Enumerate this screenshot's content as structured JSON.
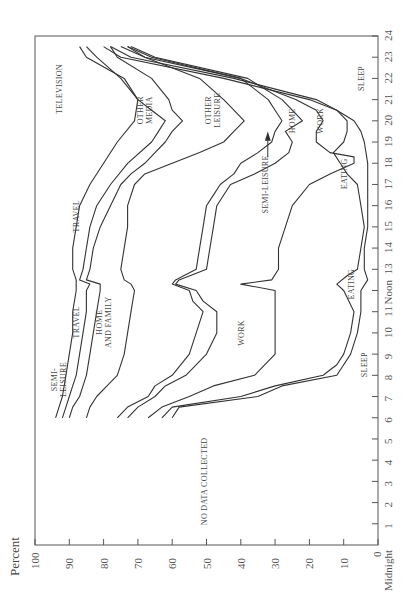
{
  "chart_data": {
    "type": "area",
    "orientation": "rotated-90-clockwise",
    "title": "",
    "ylabel": "Percent",
    "xlabel": "Hour of day",
    "ylim": [
      0,
      100
    ],
    "xlim": [
      0,
      24
    ],
    "percent_ticks": [
      100,
      90,
      80,
      70,
      60,
      50,
      40,
      30,
      20,
      10,
      0
    ],
    "hour_ticks": [
      "Midnight",
      "1",
      "2",
      "3",
      "4",
      "5",
      "6",
      "7",
      "8",
      "9",
      "10",
      "11",
      "Noon",
      "13",
      "14",
      "15",
      "16",
      "17",
      "18",
      "19",
      "20",
      "21",
      "22",
      "23",
      "24"
    ],
    "origin_labels": {
      "percent_zero": "0",
      "hour_zero": "Midnight"
    },
    "no_data_note": "NO DATA COLLECTED",
    "no_data_range_hours": [
      0,
      6
    ],
    "activities_bottom_to_top": [
      "Sleep",
      "Eating",
      "Work",
      "Home and Family",
      "Semi-leisure",
      "Travel",
      "Other Leisure",
      "Other Media",
      "Television"
    ],
    "area_labels": [
      {
        "text": "SLEEP",
        "hour": 8.5,
        "pct": 4
      },
      {
        "text": "EATING",
        "hour": 12.3,
        "pct": 8
      },
      {
        "text": "WORK",
        "hour": 10,
        "pct": 40
      },
      {
        "text": "HOME AND FAMILY",
        "hour": 10.5,
        "pct": 80
      },
      {
        "text": "TRAVEL",
        "hour": 10.5,
        "pct": 88
      },
      {
        "text": "SEMI-LEISURE",
        "hour": 7.8,
        "pct": 93
      },
      {
        "text": "TRAVEL",
        "hour": 15.5,
        "pct": 88
      },
      {
        "text": "TELEVISION",
        "hour": 21.5,
        "pct": 93
      },
      {
        "text": "OTHER MEDIA",
        "hour": 20.5,
        "pct": 68
      },
      {
        "text": "OTHER LEISURE",
        "hour": 20.5,
        "pct": 48
      },
      {
        "text": "SEMI-LEISURE",
        "hour": 17,
        "pct": 33
      },
      {
        "text": "HOME",
        "hour": 20,
        "pct": 25
      },
      {
        "text": "WORK",
        "hour": 20,
        "pct": 17
      },
      {
        "text": "EATING",
        "hour": 17.5,
        "pct": 10
      },
      {
        "text": "SLEEP",
        "hour": 22,
        "pct": 5
      }
    ],
    "series": [
      {
        "name": "Sleep (upper boundary)",
        "points": [
          [
            6,
            60
          ],
          [
            6.5,
            58
          ],
          [
            7,
            35
          ],
          [
            7.5,
            28
          ],
          [
            8,
            12
          ],
          [
            8.5,
            10
          ],
          [
            9,
            8
          ],
          [
            10,
            6
          ],
          [
            11,
            5
          ],
          [
            12,
            5
          ],
          [
            12.5,
            3
          ],
          [
            13,
            4
          ],
          [
            14,
            4
          ],
          [
            15,
            3
          ],
          [
            16,
            3
          ],
          [
            17,
            3
          ],
          [
            18,
            3
          ],
          [
            19,
            4
          ],
          [
            19.5,
            5
          ],
          [
            20,
            7
          ],
          [
            20.5,
            12
          ],
          [
            21,
            20
          ],
          [
            22,
            45
          ],
          [
            23,
            75
          ],
          [
            23.5,
            80
          ]
        ]
      },
      {
        "name": "Eating (upper boundary)",
        "points": [
          [
            6,
            63
          ],
          [
            6.5,
            60
          ],
          [
            7,
            40
          ],
          [
            7.5,
            30
          ],
          [
            8,
            16
          ],
          [
            8.5,
            12
          ],
          [
            9,
            10
          ],
          [
            10,
            8
          ],
          [
            11,
            7
          ],
          [
            12,
            10
          ],
          [
            12.3,
            12
          ],
          [
            12.7,
            9
          ],
          [
            13,
            6
          ],
          [
            14,
            5
          ],
          [
            15,
            4
          ],
          [
            16,
            5
          ],
          [
            17,
            6
          ],
          [
            17.5,
            9
          ],
          [
            18,
            11
          ],
          [
            18.5,
            13
          ],
          [
            19,
            10
          ],
          [
            19.5,
            9
          ],
          [
            20,
            9
          ],
          [
            20.5,
            12
          ],
          [
            21,
            18
          ],
          [
            22,
            42
          ],
          [
            23,
            72
          ],
          [
            23.5,
            78
          ]
        ]
      },
      {
        "name": "Work (upper boundary)",
        "points": [
          [
            6,
            67
          ],
          [
            6.5,
            63
          ],
          [
            7,
            55
          ],
          [
            7.5,
            48
          ],
          [
            8,
            36
          ],
          [
            9,
            30
          ],
          [
            10,
            30
          ],
          [
            11,
            30
          ],
          [
            12,
            30
          ],
          [
            12.3,
            40
          ],
          [
            12.5,
            31
          ],
          [
            13,
            29
          ],
          [
            14,
            29
          ],
          [
            15,
            27
          ],
          [
            16,
            25
          ],
          [
            17,
            20
          ],
          [
            17.5,
            14
          ],
          [
            18,
            7
          ],
          [
            18.3,
            7
          ],
          [
            18.5,
            14
          ],
          [
            19,
            18
          ],
          [
            19.5,
            18
          ],
          [
            20,
            16
          ],
          [
            20.5,
            18
          ],
          [
            21,
            24
          ],
          [
            22,
            40
          ],
          [
            23,
            68
          ],
          [
            23.5,
            75
          ]
        ]
      },
      {
        "name": "Home and Family (upper boundary)",
        "points": [
          [
            6,
            73
          ],
          [
            6.5,
            70
          ],
          [
            7,
            65
          ],
          [
            7.5,
            62
          ],
          [
            8,
            56
          ],
          [
            9,
            50
          ],
          [
            10,
            47
          ],
          [
            11,
            47
          ],
          [
            11.5,
            51
          ],
          [
            12,
            53
          ],
          [
            12.3,
            59
          ],
          [
            12.5,
            58
          ],
          [
            13,
            50
          ],
          [
            14,
            49
          ],
          [
            15,
            48
          ],
          [
            16,
            47
          ],
          [
            17,
            43
          ],
          [
            17.5,
            36
          ],
          [
            18,
            30
          ],
          [
            18.5,
            26
          ],
          [
            19,
            25
          ],
          [
            19.5,
            27
          ],
          [
            20,
            22
          ],
          [
            20.5,
            25
          ],
          [
            21,
            28
          ],
          [
            22,
            38
          ],
          [
            23,
            65
          ],
          [
            23.5,
            72
          ]
        ]
      },
      {
        "name": "Semi-leisure (upper boundary)",
        "points": [
          [
            6,
            76
          ],
          [
            6.5,
            73
          ],
          [
            7,
            67
          ],
          [
            7.5,
            65
          ],
          [
            8,
            60
          ],
          [
            9,
            55
          ],
          [
            10,
            53
          ],
          [
            11,
            51
          ],
          [
            11.5,
            54
          ],
          [
            12,
            55
          ],
          [
            12.3,
            60
          ],
          [
            12.5,
            59
          ],
          [
            13,
            53
          ],
          [
            14,
            52
          ],
          [
            15,
            51
          ],
          [
            16,
            50
          ],
          [
            16.5,
            48
          ],
          [
            17,
            46
          ],
          [
            17.5,
            42
          ],
          [
            18,
            40
          ],
          [
            18.5,
            35
          ],
          [
            19,
            31
          ],
          [
            19.5,
            30
          ],
          [
            20,
            28
          ],
          [
            20.5,
            30
          ],
          [
            21,
            32
          ],
          [
            22,
            40
          ],
          [
            23,
            66
          ],
          [
            23.5,
            73
          ]
        ]
      },
      {
        "name": "Travel (upper boundary)",
        "points": [
          [
            6,
            85
          ],
          [
            6.5,
            84
          ],
          [
            7,
            82
          ],
          [
            7.5,
            79
          ],
          [
            8,
            76
          ],
          [
            9,
            74
          ],
          [
            10,
            73
          ],
          [
            11,
            72
          ],
          [
            12,
            71
          ],
          [
            12.3,
            72
          ],
          [
            12.5,
            74
          ],
          [
            13,
            75
          ],
          [
            14,
            74
          ],
          [
            15,
            73
          ],
          [
            16,
            73
          ],
          [
            17,
            71
          ],
          [
            17.5,
            68
          ],
          [
            18,
            60
          ],
          [
            18.5,
            52
          ],
          [
            19,
            45
          ],
          [
            19.5,
            42
          ],
          [
            20,
            39
          ],
          [
            20.5,
            42
          ],
          [
            21,
            45
          ],
          [
            22,
            52
          ],
          [
            23,
            68
          ],
          [
            23.5,
            73
          ]
        ]
      },
      {
        "name": "Other Leisure (upper boundary)",
        "points": [
          [
            6,
            90
          ],
          [
            6.5,
            89
          ],
          [
            7,
            87
          ],
          [
            7.5,
            86
          ],
          [
            8,
            85
          ],
          [
            9,
            84
          ],
          [
            10,
            83
          ],
          [
            11,
            82
          ],
          [
            12,
            81
          ],
          [
            12.3,
            81
          ],
          [
            12.5,
            85
          ],
          [
            13,
            84
          ],
          [
            14,
            83
          ],
          [
            15,
            81
          ],
          [
            16,
            78
          ],
          [
            17,
            75
          ],
          [
            17.5,
            72
          ],
          [
            18,
            68
          ],
          [
            18.5,
            65
          ],
          [
            19,
            62
          ],
          [
            19.5,
            60
          ],
          [
            20,
            57
          ],
          [
            20.5,
            60
          ],
          [
            21,
            61
          ],
          [
            22,
            66
          ],
          [
            23,
            76
          ],
          [
            23.5,
            78
          ]
        ]
      },
      {
        "name": "Other Media (upper boundary)",
        "points": [
          [
            6,
            92
          ],
          [
            6.5,
            91
          ],
          [
            7,
            90
          ],
          [
            7.5,
            89
          ],
          [
            8,
            88
          ],
          [
            9,
            87
          ],
          [
            10,
            86
          ],
          [
            11,
            85
          ],
          [
            12,
            85
          ],
          [
            12.3,
            84
          ],
          [
            12.5,
            87
          ],
          [
            13,
            86
          ],
          [
            14,
            85
          ],
          [
            15,
            84
          ],
          [
            16,
            82
          ],
          [
            17,
            78
          ],
          [
            18,
            73
          ],
          [
            19,
            66
          ],
          [
            19.5,
            64
          ],
          [
            20,
            62
          ],
          [
            20.5,
            66
          ],
          [
            21,
            70
          ],
          [
            22,
            75
          ],
          [
            23,
            82
          ],
          [
            23.5,
            85
          ]
        ]
      },
      {
        "name": "Television (upper boundary)",
        "points": [
          [
            6,
            94
          ],
          [
            6.5,
            93
          ],
          [
            7,
            92
          ],
          [
            8,
            91
          ],
          [
            9,
            90
          ],
          [
            10,
            89
          ],
          [
            11,
            89
          ],
          [
            12,
            88
          ],
          [
            12.5,
            88
          ],
          [
            13,
            89
          ],
          [
            14,
            89
          ],
          [
            15,
            88
          ],
          [
            16,
            87
          ],
          [
            17,
            84
          ],
          [
            18,
            80
          ],
          [
            19,
            76
          ],
          [
            20,
            71
          ],
          [
            21,
            70
          ],
          [
            22,
            74
          ],
          [
            23,
            85
          ],
          [
            23.5,
            87
          ]
        ]
      }
    ]
  }
}
